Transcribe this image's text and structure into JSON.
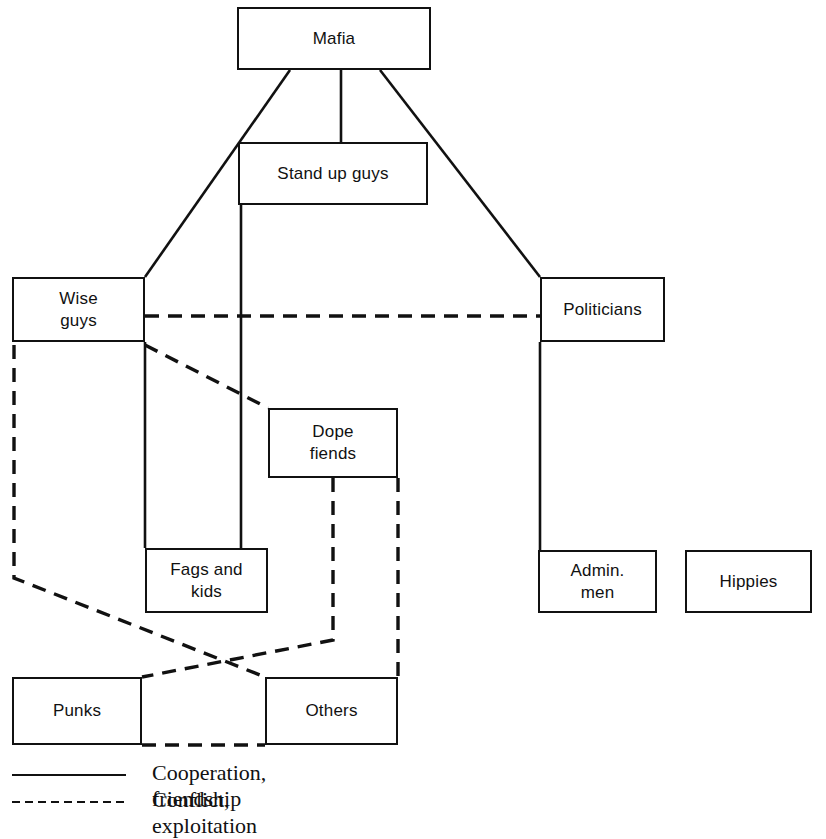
{
  "diagram": {
    "nodes": [
      {
        "id": "mafia",
        "label": "Mafia",
        "x": 237,
        "y": 7,
        "w": 194,
        "h": 63
      },
      {
        "id": "standup",
        "label": "Stand up guys",
        "x": 238,
        "y": 142,
        "w": 190,
        "h": 63
      },
      {
        "id": "wiseguys",
        "label": "Wise\nguys",
        "x": 12,
        "y": 277,
        "w": 133,
        "h": 65
      },
      {
        "id": "politicians",
        "label": "Politicians",
        "x": 540,
        "y": 277,
        "w": 125,
        "h": 65
      },
      {
        "id": "dope",
        "label": "Dope\nfiends",
        "x": 268,
        "y": 408,
        "w": 130,
        "h": 70
      },
      {
        "id": "fagskids",
        "label": "Fags and\nkids",
        "x": 145,
        "y": 548,
        "w": 123,
        "h": 65
      },
      {
        "id": "admin",
        "label": "Admin.\nmen",
        "x": 538,
        "y": 550,
        "w": 119,
        "h": 63
      },
      {
        "id": "hippies",
        "label": "Hippies",
        "x": 685,
        "y": 550,
        "w": 127,
        "h": 63
      },
      {
        "id": "punks",
        "label": "Punks",
        "x": 12,
        "y": 677,
        "w": 130,
        "h": 68
      },
      {
        "id": "others",
        "label": "Others",
        "x": 265,
        "y": 677,
        "w": 133,
        "h": 68
      }
    ],
    "edges": [
      {
        "id": "mafia-wiseguys",
        "kind": "cooperation",
        "from": "mafia",
        "to": "wiseguys",
        "points": "290,70 145,277"
      },
      {
        "id": "mafia-standup",
        "kind": "cooperation",
        "from": "mafia",
        "to": "standup",
        "points": "341,70 341,142"
      },
      {
        "id": "mafia-politicians",
        "kind": "cooperation",
        "from": "mafia",
        "to": "politicians",
        "points": "380,70 540,277"
      },
      {
        "id": "standup-fagskids",
        "kind": "cooperation",
        "from": "standup",
        "to": "fagskids",
        "points": "241,205 241,548"
      },
      {
        "id": "wiseguys-fagskids",
        "kind": "cooperation",
        "from": "wiseguys",
        "to": "fagskids",
        "points": "145,342 145,548"
      },
      {
        "id": "politicians-admin",
        "kind": "cooperation",
        "from": "politicians",
        "to": "admin",
        "points": "540,342 540,550"
      },
      {
        "id": "wiseguys-politicians",
        "kind": "conflict",
        "from": "wiseguys",
        "to": "politicians",
        "points": "145,316 540,316"
      },
      {
        "id": "wiseguys-dope",
        "kind": "conflict",
        "from": "wiseguys",
        "to": "dope",
        "points": "145,345 268,408"
      },
      {
        "id": "wiseguys-others",
        "kind": "conflict",
        "from": "wiseguys",
        "to": "others",
        "points": "14,345 14,578 265,677"
      },
      {
        "id": "dope-punks",
        "kind": "conflict",
        "from": "dope",
        "to": "punks",
        "points": "333,478 333,640 142,677"
      },
      {
        "id": "dope-others",
        "kind": "conflict",
        "from": "dope",
        "to": "others",
        "points": "398,478 398,677"
      },
      {
        "id": "punks-others",
        "kind": "conflict",
        "from": "punks",
        "to": "others",
        "points": "142,745 265,745"
      }
    ],
    "colors": {
      "line": "#111111",
      "box_border": "#111111",
      "background": "#ffffff"
    }
  },
  "legend": {
    "items": [
      {
        "id": "cooperation",
        "style": "solid",
        "label": "Cooperation, friendship"
      },
      {
        "id": "conflict",
        "style": "dashed",
        "label": "Conflict, exploitation"
      }
    ]
  }
}
